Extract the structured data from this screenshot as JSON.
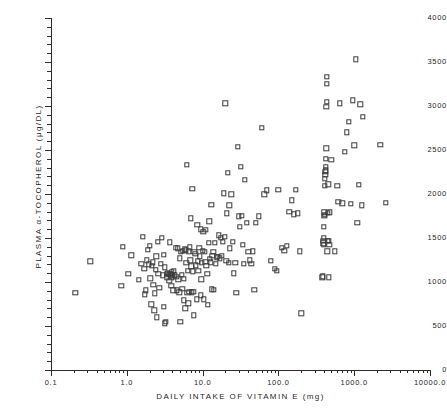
{
  "chart_data": {
    "type": "scatter",
    "title": "",
    "xlabel": "DAILY INTAKE OF VITAMIN E  (mg)",
    "ylabel": "PLASMA α-TOCOPHEROL  (μg/DL)",
    "xscale": "log",
    "yscale": "linear",
    "xlim": [
      0.1,
      10000.0
    ],
    "ylim": [
      0,
      4000
    ],
    "xticks": [
      0.1,
      1.0,
      10.0,
      100.0,
      1000.0,
      10000.0
    ],
    "xticklabels": [
      "0.1",
      "1.0",
      "10.0",
      "100.0",
      "1000.0",
      "10000.0"
    ],
    "yticks": [
      0,
      500,
      1000,
      1500,
      2000,
      2500,
      3000,
      3500,
      4000
    ],
    "yticklabels": [
      "0",
      "500",
      "1000",
      "1500",
      "2000",
      "2500",
      "3000",
      "3500",
      "4000"
    ],
    "grid": false,
    "legend": false,
    "marker": "open-square",
    "marker_color": "#3a3a3a",
    "series_name": "subjects",
    "n_points": 208,
    "points": [
      [
        0.21,
        880
      ],
      [
        0.33,
        1235
      ],
      [
        0.85,
        960
      ],
      [
        0.88,
        1400
      ],
      [
        1.05,
        1090
      ],
      [
        1.15,
        1305
      ],
      [
        1.45,
        1025
      ],
      [
        1.55,
        1205
      ],
      [
        1.62,
        1515
      ],
      [
        1.7,
        1150
      ],
      [
        1.72,
        860
      ],
      [
        1.78,
        905
      ],
      [
        1.82,
        1245
      ],
      [
        1.9,
        1365
      ],
      [
        1.95,
        1200
      ],
      [
        2.0,
        1410
      ],
      [
        2.05,
        1040
      ],
      [
        2.1,
        745
      ],
      [
        2.15,
        1185
      ],
      [
        2.2,
        1225
      ],
      [
        2.25,
        965
      ],
      [
        2.3,
        680
      ],
      [
        2.35,
        870
      ],
      [
        2.4,
        1140
      ],
      [
        2.45,
        1290
      ],
      [
        2.5,
        600
      ],
      [
        2.55,
        1455
      ],
      [
        2.6,
        1095
      ],
      [
        2.7,
        935
      ],
      [
        2.8,
        1205
      ],
      [
        2.9,
        1505
      ],
      [
        3.0,
        1075
      ],
      [
        3.05,
        720
      ],
      [
        3.1,
        1310
      ],
      [
        3.15,
        530
      ],
      [
        3.2,
        1165
      ],
      [
        3.3,
        545
      ],
      [
        3.35,
        1090
      ],
      [
        3.4,
        1055
      ],
      [
        3.5,
        1100
      ],
      [
        3.6,
        1080
      ],
      [
        3.65,
        1015
      ],
      [
        3.7,
        1450
      ],
      [
        3.75,
        1090
      ],
      [
        3.8,
        1070
      ],
      [
        3.85,
        960
      ],
      [
        3.9,
        1110
      ],
      [
        3.95,
        1045
      ],
      [
        4.0,
        1085
      ],
      [
        4.1,
        905
      ],
      [
        4.2,
        1130
      ],
      [
        4.3,
        1075
      ],
      [
        4.4,
        1390
      ],
      [
        4.5,
        1060
      ],
      [
        4.6,
        905
      ],
      [
        4.7,
        1385
      ],
      [
        4.8,
        1030
      ],
      [
        4.9,
        885
      ],
      [
        5.0,
        1270
      ],
      [
        5.1,
        545
      ],
      [
        5.2,
        1345
      ],
      [
        5.3,
        1080
      ],
      [
        5.4,
        920
      ],
      [
        5.5,
        1355
      ],
      [
        5.6,
        790
      ],
      [
        5.7,
        1035
      ],
      [
        5.8,
        1370
      ],
      [
        5.9,
        700
      ],
      [
        6.0,
        1360
      ],
      [
        6.1,
        1215
      ],
      [
        6.2,
        2335
      ],
      [
        6.3,
        875
      ],
      [
        6.4,
        1130
      ],
      [
        6.5,
        760
      ],
      [
        6.6,
        1350
      ],
      [
        6.7,
        890
      ],
      [
        6.8,
        1395
      ],
      [
        6.9,
        1245
      ],
      [
        7.0,
        1725
      ],
      [
        7.1,
        1180
      ],
      [
        7.2,
        885
      ],
      [
        7.3,
        2060
      ],
      [
        7.4,
        1120
      ],
      [
        7.5,
        890
      ],
      [
        7.6,
        620
      ],
      [
        7.8,
        1340
      ],
      [
        8.0,
        1320
      ],
      [
        8.2,
        1190
      ],
      [
        8.4,
        805
      ],
      [
        8.5,
        1650
      ],
      [
        8.6,
        1235
      ],
      [
        8.8,
        1125
      ],
      [
        9.0,
        1390
      ],
      [
        9.2,
        1290
      ],
      [
        9.4,
        850
      ],
      [
        9.5,
        1600
      ],
      [
        9.6,
        1030
      ],
      [
        9.8,
        1215
      ],
      [
        10.0,
        1355
      ],
      [
        10.2,
        1570
      ],
      [
        10.4,
        805
      ],
      [
        10.6,
        1345
      ],
      [
        10.8,
        1230
      ],
      [
        11.0,
        1595
      ],
      [
        11.2,
        1185
      ],
      [
        11.5,
        1090
      ],
      [
        11.8,
        740
      ],
      [
        12.0,
        1445
      ],
      [
        12.2,
        1690
      ],
      [
        12.5,
        1265
      ],
      [
        12.8,
        1225
      ],
      [
        13.0,
        1880
      ],
      [
        13.2,
        915
      ],
      [
        13.5,
        1300
      ],
      [
        13.8,
        1345
      ],
      [
        14.0,
        910
      ],
      [
        14.5,
        1445
      ],
      [
        15.0,
        1205
      ],
      [
        15.5,
        1280
      ],
      [
        16.0,
        1285
      ],
      [
        16.5,
        1530
      ],
      [
        17.0,
        1270
      ],
      [
        17.5,
        1505
      ],
      [
        18.0,
        1295
      ],
      [
        18.5,
        1460
      ],
      [
        19.0,
        2010
      ],
      [
        19.5,
        1515
      ],
      [
        20.0,
        3030
      ],
      [
        20.5,
        1240
      ],
      [
        21.0,
        1780
      ],
      [
        21.5,
        2240
      ],
      [
        22.0,
        1220
      ],
      [
        22.5,
        1870
      ],
      [
        23.0,
        1385
      ],
      [
        24.0,
        1995
      ],
      [
        25.0,
        1455
      ],
      [
        26.0,
        1100
      ],
      [
        27.0,
        1215
      ],
      [
        28.0,
        880
      ],
      [
        29.0,
        2535
      ],
      [
        30.0,
        1745
      ],
      [
        31.0,
        1625
      ],
      [
        32.0,
        2310
      ],
      [
        33.0,
        1755
      ],
      [
        34.0,
        1425
      ],
      [
        35.0,
        1210
      ],
      [
        36.0,
        2160
      ],
      [
        38.0,
        1670
      ],
      [
        40.0,
        1345
      ],
      [
        42.0,
        1245
      ],
      [
        44.0,
        1210
      ],
      [
        46.0,
        1350
      ],
      [
        48.0,
        910
      ],
      [
        50.0,
        1670
      ],
      [
        55.0,
        1745
      ],
      [
        60.0,
        2750
      ],
      [
        65.0,
        1995
      ],
      [
        70.0,
        2040
      ],
      [
        80.0,
        1240
      ],
      [
        90.0,
        1150
      ],
      [
        95.0,
        1125
      ],
      [
        100.0,
        2045
      ],
      [
        110.0,
        1390
      ],
      [
        120.0,
        1355
      ],
      [
        130.0,
        1410
      ],
      [
        140.0,
        1795
      ],
      [
        150.0,
        1930
      ],
      [
        160.0,
        1770
      ],
      [
        170.0,
        2045
      ],
      [
        180.0,
        1780
      ],
      [
        190.0,
        1350
      ],
      [
        200.0,
        645
      ],
      [
        380.0,
        1055
      ],
      [
        385.0,
        1065
      ],
      [
        390.0,
        1440
      ],
      [
        392.0,
        1470
      ],
      [
        395.0,
        1505
      ],
      [
        398.0,
        1425
      ],
      [
        400.0,
        1625
      ],
      [
        402.0,
        1755
      ],
      [
        405.0,
        1790
      ],
      [
        408.0,
        1765
      ],
      [
        410.0,
        2090
      ],
      [
        412.0,
        2175
      ],
      [
        415.0,
        2215
      ],
      [
        418.0,
        2250
      ],
      [
        420.0,
        2270
      ],
      [
        422.0,
        2310
      ],
      [
        425.0,
        2400
      ],
      [
        428.0,
        2520
      ],
      [
        430.0,
        2990
      ],
      [
        432.0,
        3050
      ],
      [
        435.0,
        3255
      ],
      [
        438.0,
        3330
      ],
      [
        440.0,
        1350
      ],
      [
        445.0,
        1465
      ],
      [
        450.0,
        1785
      ],
      [
        455.0,
        2110
      ],
      [
        460.0,
        1470
      ],
      [
        465.0,
        1055
      ],
      [
        470.0,
        1420
      ],
      [
        480.0,
        1790
      ],
      [
        500.0,
        2390
      ],
      [
        550.0,
        1350
      ],
      [
        600.0,
        2090
      ],
      [
        620.0,
        1910
      ],
      [
        650.0,
        3030
      ],
      [
        700.0,
        1895
      ],
      [
        750.0,
        2480
      ],
      [
        800.0,
        2700
      ],
      [
        850.0,
        2820
      ],
      [
        900.0,
        1890
      ],
      [
        950.0,
        3065
      ],
      [
        1000.0,
        2555
      ],
      [
        1050.0,
        3530
      ],
      [
        1100.0,
        1670
      ],
      [
        1150.0,
        2105
      ],
      [
        1200.0,
        3020
      ],
      [
        1250.0,
        1870
      ],
      [
        1300.0,
        2880
      ],
      [
        2200.0,
        2560
      ],
      [
        2600.0,
        1900
      ]
    ]
  },
  "axes": {
    "x_minor_count_per_decade": 9,
    "y_minor_step": 100
  }
}
